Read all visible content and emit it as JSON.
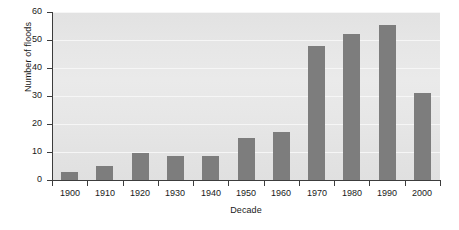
{
  "chart_data": {
    "type": "bar",
    "title": "",
    "xlabel": "Decade",
    "ylabel": "Number of floods",
    "categories": [
      "1900",
      "1910",
      "1920",
      "1930",
      "1940",
      "1950",
      "1960",
      "1970",
      "1980",
      "1990",
      "2000"
    ],
    "values": [
      3,
      5,
      9.5,
      8.5,
      8.5,
      15,
      17,
      48,
      52,
      55.5,
      31
    ],
    "ylim": [
      0,
      60
    ],
    "yticks": [
      0,
      10,
      20,
      30,
      40,
      50,
      60
    ],
    "ytick_labels": [
      "0",
      "10",
      "20",
      "30",
      "40",
      "50",
      "60"
    ],
    "grid": true,
    "grid_axis": "y",
    "legend": false,
    "legend_position": "none",
    "series": [
      {
        "name": "Number of floods",
        "values": [
          3,
          5,
          9.5,
          8.5,
          8.5,
          15,
          17,
          48,
          52,
          55.5,
          31
        ]
      }
    ],
    "colors": {
      "bar": "#7d7d7d",
      "plot_background": "#e6e6e6",
      "gridline": "#f6f6f6",
      "axis": "#3c3c3c",
      "text": "#1a1a1a",
      "figure_background": "#ffffff"
    }
  }
}
